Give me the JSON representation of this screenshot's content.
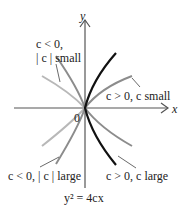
{
  "figure": {
    "axis_labels": {
      "x": "x",
      "y": "y",
      "origin": "0"
    },
    "equation": "y² = 4cx",
    "labels": {
      "c_neg_small_line1": "c < 0,",
      "c_neg_small_line2": "| c | small",
      "c_pos_small": "c > 0, c small",
      "c_neg_large": "c < 0, | c | large",
      "c_pos_large": "c > 0, c large"
    },
    "curves": [
      {
        "name": "c > 0, c large",
        "color": "#111111"
      },
      {
        "name": "c > 0, c small",
        "color": "#8a8a8a"
      },
      {
        "name": "c < 0, |c| small",
        "color": "#b5b5b5"
      },
      {
        "name": "c < 0, |c| large",
        "color": "#8a8a8a"
      }
    ]
  }
}
